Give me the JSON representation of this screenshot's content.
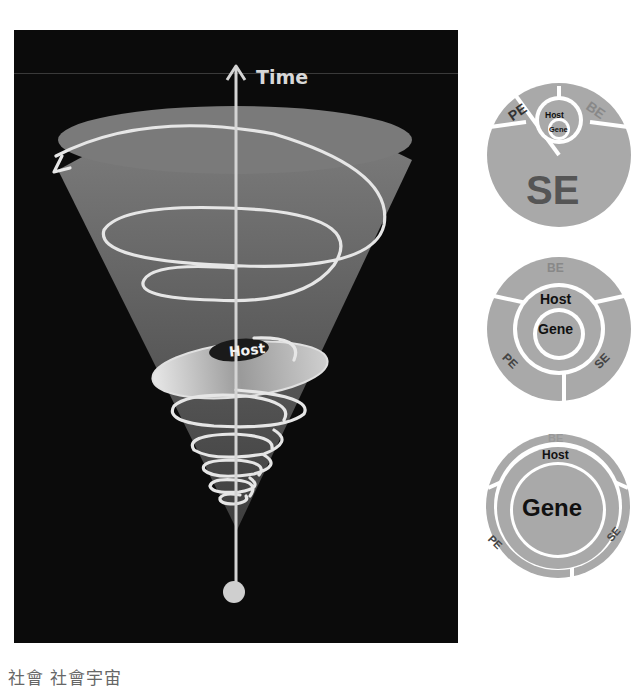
{
  "cone_diagram": {
    "axis_label": "Time",
    "ring_label": "Host",
    "colors": {
      "background": "#0b0b0b",
      "cone": "#7a7a7a",
      "spiral": "#e6e6e6",
      "axis": "#d0d0d0"
    }
  },
  "discs": [
    {
      "name": "disc-se-dominant",
      "outer_labels": {
        "top_left": "PE",
        "top_right": "BE",
        "bottom": "SE"
      },
      "inner_labels": {
        "host": "Host",
        "gene": "Gene"
      }
    },
    {
      "name": "disc-host-dominant",
      "outer_labels": {
        "top": "BE",
        "left": "PE",
        "right": "SE"
      },
      "inner_labels": {
        "host": "Host",
        "gene": "Gene"
      }
    },
    {
      "name": "disc-gene-dominant",
      "outer_labels": {
        "top": "BE",
        "left": "PE",
        "right": "SE"
      },
      "inner_labels": {
        "host": "Host",
        "gene": "Gene"
      }
    }
  ],
  "caption": "社會 社會宇宙"
}
